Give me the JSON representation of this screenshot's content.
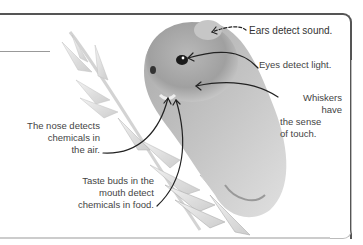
{
  "diagram": {
    "labels": [
      {
        "id": "ears",
        "text": "Ears detect sound."
      },
      {
        "id": "eyes",
        "text": "Eyes detect light."
      },
      {
        "id": "whiskers",
        "lines": [
          "Whiskers have",
          "the sense",
          "of touch."
        ]
      },
      {
        "id": "nose",
        "lines": [
          "The nose detects",
          "chemicals in",
          "the air."
        ]
      },
      {
        "id": "taste",
        "lines": [
          "Taste buds in the",
          "mouth detect",
          "chemicals in food."
        ]
      }
    ],
    "colors": {
      "frame": "#555555",
      "frame_light": "#bbbbbb",
      "text": "#444444",
      "arrow": "#222222"
    }
  }
}
